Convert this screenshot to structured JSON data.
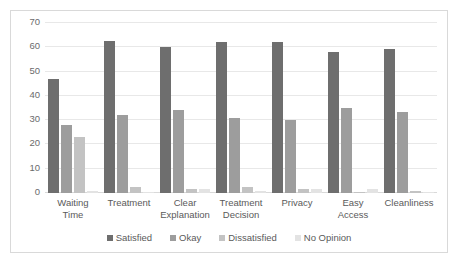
{
  "chart_data": {
    "type": "bar",
    "title": "",
    "subtitle": "",
    "xlabel": "",
    "ylabel": "",
    "ylim": [
      0,
      70
    ],
    "yticks": [
      0,
      10,
      20,
      30,
      40,
      50,
      60,
      70
    ],
    "grid": true,
    "legend_position": "bottom",
    "categories": [
      "Waiting\nTime",
      "Treatment",
      "Clear\nExplanation",
      "Treatment\nDecision",
      "Privacy",
      "Easy\nAccess",
      "Cleanliness"
    ],
    "series": [
      {
        "name": "Satisfied",
        "color": "#6e6e6e",
        "values": [
          47,
          62.5,
          60,
          62,
          62,
          58,
          59.5
        ]
      },
      {
        "name": "Okay",
        "color": "#9d9d9d",
        "values": [
          28,
          32,
          34,
          31,
          30,
          35,
          33.5
        ]
      },
      {
        "name": "Dissatisfied",
        "color": "#c3c3c3",
        "values": [
          23,
          2.5,
          1.5,
          2.5,
          1.5,
          0.5,
          0.8
        ]
      },
      {
        "name": "No Opinion",
        "color": "#e3e3e3",
        "values": [
          1,
          0.6,
          1.5,
          0.8,
          1.5,
          1.5,
          0.3
        ]
      }
    ]
  },
  "colors": {
    "satisfied": "#6e6e6e",
    "okay": "#9d9d9d",
    "dissatisfied": "#c3c3c3",
    "no_opinion": "#e3e3e3",
    "gridline": "#e8e8e8",
    "border": "#d9d9d9",
    "text": "#5a5a5a"
  }
}
